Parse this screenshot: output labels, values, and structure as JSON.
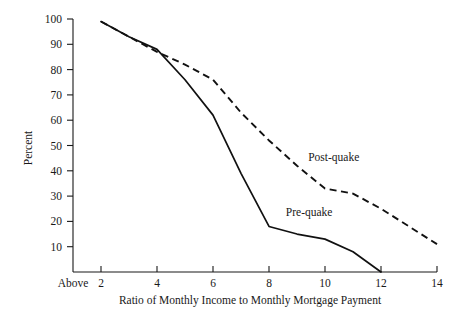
{
  "chart_data": {
    "type": "line",
    "title": "",
    "xlabel": "Ratio of Monthly Income to Monthly Mortgage Payment",
    "ylabel": "Percent",
    "xlim": [
      1,
      14
    ],
    "ylim": [
      0,
      100
    ],
    "grid": false,
    "legend_position": "inline-annotation",
    "x_tick_labels": [
      "Above",
      "2",
      "4",
      "6",
      "8",
      "10",
      "12",
      "14"
    ],
    "x_tick_values": [
      1,
      2,
      4,
      6,
      8,
      10,
      12,
      14
    ],
    "y_tick_labels": [
      "10",
      "20",
      "30",
      "40",
      "50",
      "60",
      "70",
      "80",
      "90",
      "100"
    ],
    "y_tick_values": [
      10,
      20,
      30,
      40,
      50,
      60,
      70,
      80,
      90,
      100
    ],
    "series": [
      {
        "name": "Pre-quake",
        "style": "solid",
        "x": [
          2,
          3,
          4,
          5,
          6,
          7,
          8,
          9,
          10,
          11,
          12
        ],
        "values": [
          99,
          93,
          88,
          76,
          62,
          39,
          18,
          15,
          13,
          8,
          0
        ],
        "label_x": 8.6,
        "label_y": 22
      },
      {
        "name": "Post-quake",
        "style": "dashed",
        "x": [
          2,
          3,
          4,
          5,
          6,
          7,
          8,
          9,
          10,
          11,
          12,
          13,
          14
        ],
        "values": [
          99,
          93,
          87,
          82,
          76,
          63,
          52,
          42,
          33,
          31,
          25,
          18,
          11
        ],
        "label_x": 9.4,
        "label_y": 44
      }
    ],
    "annotations": [
      {
        "text": "Post-quake",
        "x": 9.4,
        "y": 44
      },
      {
        "text": "Pre-quake",
        "x": 8.6,
        "y": 22
      }
    ]
  }
}
